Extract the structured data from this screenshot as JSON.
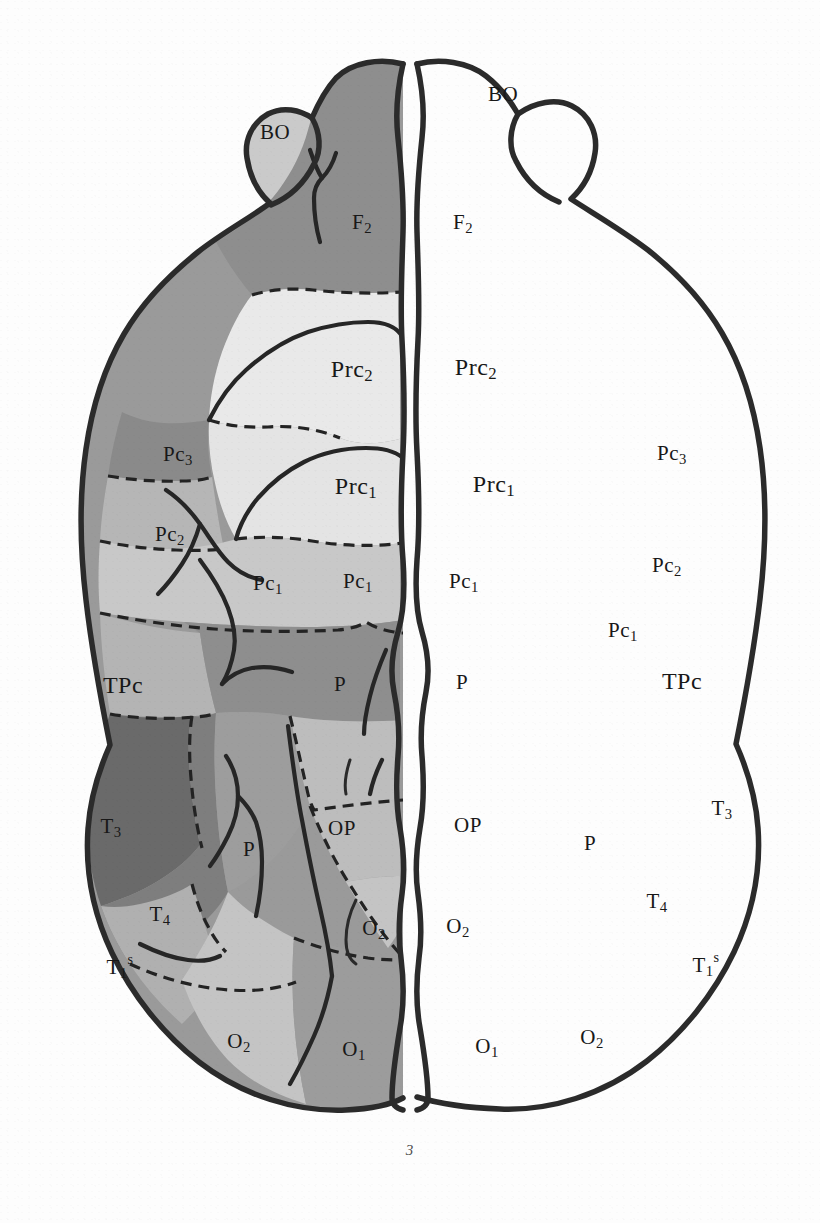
{
  "figure": {
    "number": "3",
    "type": "cytoarchitectonic brain map, dorsal view",
    "caption": "3"
  },
  "palette": {
    "background": "#ffffff",
    "outline": "#2b2b2b",
    "label_color": "#181818",
    "shade_lightest": "#e9e9e9",
    "shade_light": "#d2d2d2",
    "shade_light_mid": "#c2c2c2",
    "shade_mid": "#b0b0b0",
    "shade_mid_dark": "#9a9a9a",
    "shade_dark": "#8a8a8a",
    "shade_darker": "#7c7c7c",
    "shade_darkest": "#6a6a6a"
  },
  "regions": [
    {
      "key": "BO_left",
      "label": "BO",
      "sub": "",
      "sup": "",
      "shade": "#c9c9c9",
      "side": "left",
      "x": 275,
      "y": 134
    },
    {
      "key": "BO_right",
      "label": "BO",
      "sub": "",
      "sup": "",
      "shade": "#c9c9c9",
      "side": "right",
      "x": 503,
      "y": 96
    },
    {
      "key": "F2_left",
      "label": "F",
      "sub": "2",
      "sup": "",
      "shade": "#8f8f8f",
      "side": "left",
      "x": 362,
      "y": 224
    },
    {
      "key": "F2_right",
      "label": "F",
      "sub": "2",
      "sup": "",
      "shade": "#8f8f8f",
      "side": "right",
      "x": 463,
      "y": 224
    },
    {
      "key": "Prc2_left",
      "label": "Prc",
      "sub": "2",
      "sup": "",
      "shade": "#e9e9e9",
      "side": "left",
      "x": 352,
      "y": 371
    },
    {
      "key": "Prc2_right",
      "label": "Prc",
      "sub": "2",
      "sup": "",
      "shade": "#e9e9e9",
      "side": "right",
      "x": 476,
      "y": 369
    },
    {
      "key": "Prc1_left",
      "label": "Prc",
      "sub": "1",
      "sup": "",
      "shade": "#e4e4e4",
      "side": "left",
      "x": 356,
      "y": 488
    },
    {
      "key": "Prc1_right",
      "label": "Prc",
      "sub": "1",
      "sup": "",
      "shade": "#e4e4e4",
      "side": "right",
      "x": 494,
      "y": 486
    },
    {
      "key": "Pc3_left",
      "label": "Pc",
      "sub": "3",
      "sup": "",
      "shade": "#8a8a8a",
      "side": "left",
      "x": 178,
      "y": 456
    },
    {
      "key": "Pc3_right",
      "label": "Pc",
      "sub": "3",
      "sup": "",
      "shade": "#8a8a8a",
      "side": "right",
      "x": 672,
      "y": 455
    },
    {
      "key": "Pc2_left",
      "label": "Pc",
      "sub": "2",
      "sup": "",
      "shade": "#b6b6b6",
      "side": "left",
      "x": 170,
      "y": 536
    },
    {
      "key": "Pc2_right",
      "label": "Pc",
      "sub": "2",
      "sup": "",
      "shade": "#b6b6b6",
      "side": "right",
      "x": 667,
      "y": 567
    },
    {
      "key": "Pc1_left_lat",
      "label": "Pc",
      "sub": "1",
      "sup": "",
      "shade": "#c8c8c8",
      "side": "left",
      "x": 268,
      "y": 585
    },
    {
      "key": "Pc1_left_med",
      "label": "Pc",
      "sub": "1",
      "sup": "",
      "shade": "#c8c8c8",
      "side": "left",
      "x": 358,
      "y": 583
    },
    {
      "key": "Pc1_right_med",
      "label": "Pc",
      "sub": "1",
      "sup": "",
      "shade": "#c8c8c8",
      "side": "right",
      "x": 464,
      "y": 583
    },
    {
      "key": "Pc1_right_lat",
      "label": "Pc",
      "sub": "1",
      "sup": "",
      "shade": "#c8c8c8",
      "side": "right",
      "x": 623,
      "y": 632
    },
    {
      "key": "TPc_left",
      "label": "TPc",
      "sub": "",
      "sup": "",
      "shade": "#b4b4b4",
      "side": "left",
      "x": 123,
      "y": 687
    },
    {
      "key": "TPc_right",
      "label": "TPc",
      "sub": "",
      "sup": "",
      "shade": "#b4b4b4",
      "side": "right",
      "x": 682,
      "y": 683
    },
    {
      "key": "P_left_sup",
      "label": "P",
      "sub": "",
      "sup": "",
      "shade": "#8e8e8e",
      "side": "left",
      "x": 340,
      "y": 686
    },
    {
      "key": "P_right_sup",
      "label": "P",
      "sub": "",
      "sup": "",
      "shade": "#8e8e8e",
      "side": "right",
      "x": 462,
      "y": 684
    },
    {
      "key": "P_left_inf",
      "label": "P",
      "sub": "",
      "sup": "",
      "shade": "#9d9d9d",
      "side": "left",
      "x": 249,
      "y": 851
    },
    {
      "key": "P_right_inf",
      "label": "P",
      "sub": "",
      "sup": "",
      "shade": "#9d9d9d",
      "side": "right",
      "x": 590,
      "y": 845
    },
    {
      "key": "OP_left",
      "label": "OP",
      "sub": "",
      "sup": "",
      "shade": "#bdbdbd",
      "side": "left",
      "x": 342,
      "y": 830
    },
    {
      "key": "OP_right",
      "label": "OP",
      "sub": "",
      "sup": "",
      "shade": "#bdbdbd",
      "side": "right",
      "x": 468,
      "y": 827
    },
    {
      "key": "T3_left",
      "label": "T",
      "sub": "3",
      "sup": "",
      "shade": "#6a6a6a",
      "side": "left",
      "x": 111,
      "y": 828
    },
    {
      "key": "T3_right",
      "label": "T",
      "sub": "3",
      "sup": "",
      "shade": "#6a6a6a",
      "side": "right",
      "x": 722,
      "y": 810
    },
    {
      "key": "T4_left",
      "label": "T",
      "sub": "4",
      "sup": "",
      "shade": "#7e7e7e",
      "side": "left",
      "x": 160,
      "y": 916
    },
    {
      "key": "T4_right",
      "label": "T",
      "sub": "4",
      "sup": "",
      "shade": "#7e7e7e",
      "side": "right",
      "x": 657,
      "y": 903
    },
    {
      "key": "T1s_left",
      "label": "T",
      "sub": "1",
      "sup": "s",
      "shade": "#b0b0b0",
      "side": "left",
      "x": 120,
      "y": 969
    },
    {
      "key": "T1s_right",
      "label": "T",
      "sub": "1",
      "sup": "s",
      "shade": "#b0b0b0",
      "side": "right",
      "x": 706,
      "y": 967
    },
    {
      "key": "O2_left_med",
      "label": "O",
      "sub": "2",
      "sup": "",
      "shade": "#c4c4c4",
      "side": "left",
      "x": 374,
      "y": 930
    },
    {
      "key": "O2_right_med",
      "label": "O",
      "sub": "2",
      "sup": "",
      "shade": "#c4c4c4",
      "side": "right",
      "x": 458,
      "y": 928
    },
    {
      "key": "O2_left_inf",
      "label": "O",
      "sub": "2",
      "sup": "",
      "shade": "#c4c4c4",
      "side": "left",
      "x": 239,
      "y": 1043
    },
    {
      "key": "O2_right_inf",
      "label": "O",
      "sub": "2",
      "sup": "",
      "shade": "#c4c4c4",
      "side": "right",
      "x": 592,
      "y": 1039
    },
    {
      "key": "O1_left",
      "label": "O",
      "sub": "1",
      "sup": "",
      "shade": "#9c9c9c",
      "side": "left",
      "x": 354,
      "y": 1051
    },
    {
      "key": "O1_right",
      "label": "O",
      "sub": "1",
      "sup": "",
      "shade": "#9c9c9c",
      "side": "right",
      "x": 487,
      "y": 1048
    }
  ],
  "region_legend": [
    {
      "abbr": "BO",
      "meaning": "bulbus olfactorius"
    },
    {
      "abbr": "F2",
      "meaning": "frontal area 2"
    },
    {
      "abbr": "Prc1",
      "meaning": "precentral area 1"
    },
    {
      "abbr": "Prc2",
      "meaning": "precentral area 2"
    },
    {
      "abbr": "Pc1",
      "meaning": "postcentral area 1"
    },
    {
      "abbr": "Pc2",
      "meaning": "postcentral area 2"
    },
    {
      "abbr": "Pc3",
      "meaning": "postcentral area 3"
    },
    {
      "abbr": "TPc",
      "meaning": "temporo-postcentral area"
    },
    {
      "abbr": "P",
      "meaning": "parietal area"
    },
    {
      "abbr": "OP",
      "meaning": "occipito-parietal area"
    },
    {
      "abbr": "O1",
      "meaning": "occipital area 1"
    },
    {
      "abbr": "O2",
      "meaning": "occipital area 2"
    },
    {
      "abbr": "T1s",
      "meaning": "temporal area 1 superior"
    },
    {
      "abbr": "T3",
      "meaning": "temporal area 3"
    },
    {
      "abbr": "T4",
      "meaning": "temporal area 4"
    }
  ]
}
